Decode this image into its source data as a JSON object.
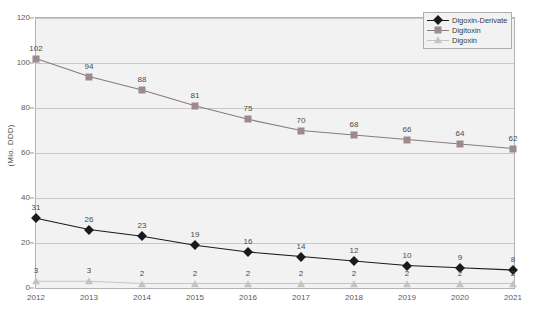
{
  "chart_data": {
    "type": "line",
    "title": "",
    "xlabel": "",
    "ylabel": "(Mio. DDD)",
    "ylim": [
      0,
      120
    ],
    "ytick_step": 20,
    "yticks": [
      0,
      20,
      40,
      60,
      80,
      100,
      120
    ],
    "grid": true,
    "legend_position": "top-right",
    "categories": [
      "2012",
      "2013",
      "2014",
      "2015",
      "2016",
      "2017",
      "2018",
      "2019",
      "2020",
      "2021"
    ],
    "series": [
      {
        "name": "Digoxin-Derivate",
        "marker": "diamond",
        "color": "#1a1a1a",
        "line_color": "#1a1a1a",
        "values": [
          31,
          26,
          23,
          19,
          16,
          14,
          12,
          10,
          9,
          8
        ]
      },
      {
        "name": "Digitoxin",
        "marker": "square",
        "color": "#9c8a8f",
        "line_color": "#8c7a80",
        "values": [
          102,
          94,
          88,
          81,
          75,
          70,
          68,
          66,
          64,
          62
        ]
      },
      {
        "name": "Digoxin",
        "marker": "triangle",
        "color": "#c3c3c3",
        "line_color": "#c3c3c3",
        "values": [
          3,
          3,
          2,
          2,
          2,
          2,
          2,
          2,
          2,
          2
        ]
      }
    ]
  },
  "colors": {
    "plot_background": "#f2f2f2",
    "plot_border": "#b4b4b4",
    "gridline": "#c8c8c8",
    "axis_text": "#5a5a5a",
    "label_text": "#4a4a4a"
  },
  "legend": {
    "items": [
      {
        "label": "Digoxin-Derivate"
      },
      {
        "label": "Digitoxin"
      },
      {
        "label": "Digoxin"
      }
    ]
  }
}
